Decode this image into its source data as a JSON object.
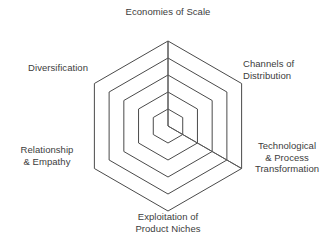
{
  "chart_data": {
    "type": "radar",
    "title": "",
    "subtitle": "",
    "xlabel": "",
    "ylabel": "",
    "grid": true,
    "grid_shape": "hexagon",
    "grid_rings": 5,
    "legend": false,
    "legend_position": "none",
    "rlim": [
      0,
      5
    ],
    "categories": [
      "Economies of Scale",
      "Channels of Distribution",
      "Technological & Process Transformation",
      "Exploitation of Product Niches",
      "Relationship & Empathy",
      "Diversification"
    ],
    "series": [
      {
        "name": "",
        "values": [
          5,
          0,
          5,
          0,
          0,
          0
        ],
        "fill_color": "#595959",
        "line_color": "#595959"
      }
    ],
    "axis_order_clockwise_from_top": true,
    "colors": {
      "grid_stroke": "#4a4a4a",
      "label_text": "#3c3c3c",
      "background": "#ffffff",
      "data_fill": "#595959"
    }
  },
  "labels": {
    "top": "Economies of Scale",
    "upper_right_line1": "Channels of",
    "upper_right_line2": "Distribution",
    "lower_right_line1": "Technological",
    "lower_right_line2": "& Process",
    "lower_right_line3": "Transformation",
    "bottom_line1": "Exploitation of",
    "bottom_line2": "Product Niches",
    "lower_left_line1": "Relationship",
    "lower_left_line2": "& Empathy",
    "upper_left": "Diversification"
  },
  "geometry": {
    "center_x": 168,
    "center_y": 126,
    "outer_radius": 85,
    "rings": 5
  }
}
